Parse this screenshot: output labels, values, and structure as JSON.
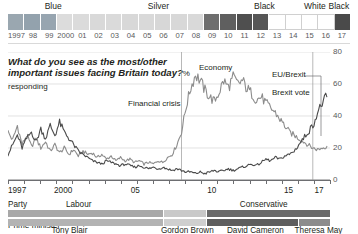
{
  "top_band": {
    "labels": [
      {
        "text": "Blue",
        "left_pct": 4.2,
        "width_pct": 18.0
      },
      {
        "text": "Silver",
        "left_pct": 22.5,
        "width_pct": 43.0
      },
      {
        "text": "Black",
        "left_pct": 65.5,
        "width_pct": 19.0
      },
      {
        "text": "White",
        "left_pct": 84.0,
        "width_pct": 11.5
      },
      {
        "text": "Black",
        "left_pct": 93.5,
        "width_pct": 6.5
      }
    ],
    "years": [
      "1997",
      "98",
      "99",
      "2000",
      "01",
      "02",
      "03",
      "04",
      "05",
      "06",
      "07",
      "08",
      "09",
      "10",
      "11",
      "12",
      "13",
      "14",
      "15",
      "16",
      "17"
    ],
    "cell_colors": [
      "#9aa7b0",
      "#93a2ad",
      "#97a5b0",
      "#dcdcdc",
      "#dbdbdb",
      "#d9d9d9",
      "#dadada",
      "#d8d8d8",
      "#d9d9d9",
      "#d7d7d7",
      "#d8d8d8",
      "#d9d9d9",
      "#6e6e6e",
      "#5f5f5f",
      "#4f4f4f",
      "#565656",
      "#ffffff",
      "#ffffff",
      "#ffffff",
      "#ffffff",
      "#4a4a4a"
    ]
  },
  "title": {
    "question": "What do you see as the most/other important issues facing Britain today?",
    "unit": "% responding"
  },
  "annotations": [
    {
      "name": "economy",
      "text": "Economy"
    },
    {
      "name": "financial-crisis",
      "text": "Financial crisis"
    },
    {
      "name": "eu-brexit",
      "text": "EU/Brexit"
    },
    {
      "name": "brexit-vote",
      "text": "Brexit vote"
    }
  ],
  "axis": {
    "y_ticks": [
      "0",
      "20",
      "40",
      "60",
      "80"
    ],
    "x_labels": [
      {
        "text": "1997",
        "x_pct": 0.0
      },
      {
        "text": "2000",
        "x_pct": 14.3
      },
      {
        "text": "05",
        "x_pct": 38.1
      },
      {
        "text": "10",
        "x_pct": 61.9
      },
      {
        "text": "15",
        "x_pct": 85.7
      },
      {
        "text": "17",
        "x_pct": 95.2
      }
    ]
  },
  "party_row": {
    "row_label": "Party",
    "segments": [
      {
        "label": "Labour",
        "color": "#a8a8a8",
        "start_pct": 0.0,
        "end_pct": 48.6
      },
      {
        "label": "",
        "color": "#c9c9c9",
        "start_pct": 48.6,
        "end_pct": 61.9
      },
      {
        "label": "Conservative",
        "color": "#6a6a6a",
        "start_pct": 61.9,
        "end_pct": 100.0
      }
    ],
    "label_positions": [
      {
        "text": "Labour",
        "left_pct": 18.0
      },
      {
        "text": "Conservative",
        "left_pct": 72.0
      }
    ]
  },
  "pm_row": {
    "row_label": "Prime minister",
    "segments": [
      {
        "label": "Tony Blair",
        "color": "#b3b3b3",
        "start_pct": 0.0,
        "end_pct": 48.6
      },
      {
        "label": "Gordon Brown",
        "color": "#cfcfcf",
        "start_pct": 48.6,
        "end_pct": 61.9
      },
      {
        "label": "David Cameron",
        "color": "#5e5e5e",
        "start_pct": 61.9,
        "end_pct": 90.5
      },
      {
        "label": "Theresa May",
        "color": "#8c8c8c",
        "start_pct": 90.5,
        "end_pct": 100.0
      }
    ],
    "label_positions": [
      {
        "text": "Tony Blair",
        "left_pct": 13.5
      },
      {
        "text": "Gordon Brown",
        "left_pct": 47.5
      },
      {
        "text": "David Cameron",
        "left_pct": 68.0
      },
      {
        "text": "Theresa May",
        "left_pct": 89.0
      }
    ]
  },
  "chart_data": {
    "type": "line",
    "title": "What do you see as the most/other important issues facing Britain today?",
    "xlabel": "",
    "ylabel": "% responding",
    "ylim": [
      0,
      80
    ],
    "xlim": [
      1997,
      2017.6
    ],
    "grid": true,
    "legend": "inline-annotations",
    "colors": {
      "economy": "#8c8c8c",
      "eu_brexit": "#4a4a4a"
    },
    "series": [
      {
        "name": "Economy",
        "color": "#8c8c8c",
        "x": [
          1997.0,
          1997.3,
          1997.6,
          1997.9,
          1998.2,
          1998.5,
          1998.8,
          1999.1,
          1999.4,
          1999.7,
          2000.0,
          2000.3,
          2000.6,
          2000.9,
          2001.2,
          2001.5,
          2001.8,
          2002.1,
          2002.4,
          2002.7,
          2003.0,
          2003.3,
          2003.6,
          2003.9,
          2004.2,
          2004.5,
          2004.8,
          2005.1,
          2005.4,
          2005.7,
          2006.0,
          2006.3,
          2006.6,
          2006.9,
          2007.2,
          2007.5,
          2007.8,
          2008.1,
          2008.4,
          2008.7,
          2009.0,
          2009.3,
          2009.6,
          2009.9,
          2010.2,
          2010.5,
          2010.8,
          2011.1,
          2011.4,
          2011.7,
          2012.0,
          2012.3,
          2012.6,
          2012.9,
          2013.2,
          2013.5,
          2013.8,
          2014.1,
          2014.4,
          2014.7,
          2015.0,
          2015.3,
          2015.6,
          2015.9,
          2016.2,
          2016.5,
          2016.8,
          2017.1,
          2017.4
        ],
        "y": [
          30,
          25,
          34,
          22,
          28,
          21,
          26,
          20,
          24,
          18,
          22,
          17,
          20,
          16,
          19,
          15,
          18,
          16,
          17,
          14,
          16,
          13,
          15,
          12,
          14,
          12,
          13,
          11,
          12,
          10,
          11,
          10,
          12,
          11,
          14,
          16,
          22,
          30,
          46,
          58,
          66,
          62,
          56,
          52,
          49,
          55,
          62,
          58,
          64,
          60,
          62,
          57,
          54,
          50,
          52,
          48,
          45,
          42,
          38,
          34,
          30,
          28,
          26,
          24,
          22,
          20,
          19,
          20,
          21
        ]
      },
      {
        "name": "EU/Brexit",
        "color": "#4a4a4a",
        "x": [
          1997.0,
          1997.3,
          1997.6,
          1997.9,
          1998.2,
          1998.5,
          1998.8,
          1999.1,
          1999.4,
          1999.7,
          2000.0,
          2000.3,
          2000.6,
          2000.9,
          2001.2,
          2001.5,
          2001.8,
          2002.1,
          2002.4,
          2002.7,
          2003.0,
          2003.3,
          2003.6,
          2003.9,
          2004.2,
          2004.5,
          2004.8,
          2005.1,
          2005.4,
          2005.7,
          2006.0,
          2006.3,
          2006.6,
          2006.9,
          2007.2,
          2007.5,
          2007.8,
          2008.1,
          2008.4,
          2008.7,
          2009.0,
          2009.3,
          2009.6,
          2009.9,
          2010.2,
          2010.5,
          2010.8,
          2011.1,
          2011.4,
          2011.7,
          2012.0,
          2012.3,
          2012.6,
          2012.9,
          2013.2,
          2013.5,
          2013.8,
          2014.1,
          2014.4,
          2014.7,
          2015.0,
          2015.3,
          2015.6,
          2015.9,
          2016.2,
          2016.5,
          2016.8,
          2017.1,
          2017.4
        ],
        "y": [
          16,
          22,
          28,
          20,
          26,
          30,
          24,
          32,
          26,
          34,
          28,
          36,
          30,
          26,
          22,
          18,
          16,
          14,
          12,
          11,
          10,
          12,
          11,
          10,
          9,
          10,
          9,
          8,
          9,
          8,
          7,
          8,
          7,
          8,
          7,
          6,
          7,
          6,
          5,
          5,
          4,
          5,
          4,
          5,
          6,
          5,
          6,
          7,
          6,
          7,
          8,
          9,
          10,
          9,
          11,
          13,
          12,
          14,
          13,
          15,
          16,
          18,
          22,
          26,
          30,
          34,
          42,
          48,
          52
        ]
      }
    ],
    "event_markers": [
      {
        "label": "Financial crisis",
        "x": 2008.1
      },
      {
        "label": "Brexit vote",
        "x": 2016.5
      }
    ]
  }
}
